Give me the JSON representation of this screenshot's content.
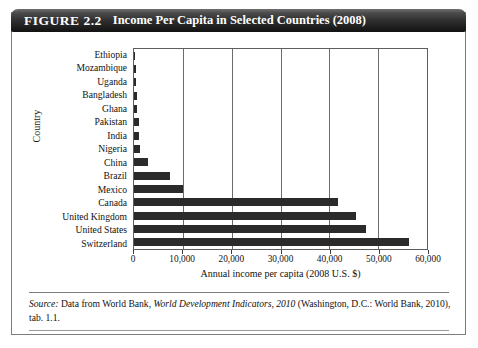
{
  "figure": {
    "number": "FIGURE 2.2",
    "title": "Income Per Capita in Selected Countries (2008)"
  },
  "source": {
    "label": "Source:",
    "text_before_italic": " Data from World Bank, ",
    "italic_title": "World Development Indicators, 2010",
    "text_after_italic": " (Washington, D.C.: World Bank, 2010), tab. 1.1."
  },
  "colors": {
    "bar": "#2b2b2b",
    "gridline": "#6b6b6b",
    "plot_border": "#5d5d5d",
    "banner_dark": "#121212",
    "banner_light": "#6f6f6f",
    "frame": "#7d7d7d",
    "text": "#111111"
  },
  "chart_data": {
    "type": "bar",
    "orientation": "horizontal",
    "title": "Income Per Capita in Selected Countries (2008)",
    "xlabel": "Annual income per capita (2008 U.S. $)",
    "ylabel": "Country",
    "xlim": [
      0,
      60000
    ],
    "xticks": [
      0,
      10000,
      20000,
      30000,
      40000,
      50000,
      60000
    ],
    "xtick_labels": [
      "0",
      "10,000",
      "20,000",
      "30,000",
      "40,000",
      "50,000",
      "60,000"
    ],
    "grid": true,
    "grid_axis": "x",
    "legend": false,
    "categories": [
      "Ethiopia",
      "Mozambique",
      "Uganda",
      "Bangladesh",
      "Ghana",
      "Pakistan",
      "India",
      "Nigeria",
      "China",
      "Brazil",
      "Mexico",
      "Canada",
      "United Kingdom",
      "United States",
      "Switzerland"
    ],
    "values": [
      280,
      370,
      420,
      520,
      670,
      980,
      1070,
      1160,
      2940,
      7350,
      9980,
      41730,
      45390,
      47580,
      56370
    ],
    "value_unit": "2008 U.S. $"
  }
}
